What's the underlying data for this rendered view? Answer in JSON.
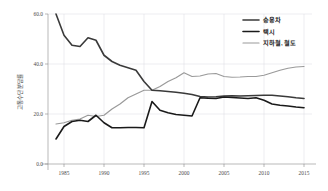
{
  "chart_data": {
    "type": "line",
    "title": "",
    "xlabel": "",
    "ylabel": "교통수단 분담률",
    "xlim": [
      1983,
      2016
    ],
    "ylim": [
      0.0,
      60.0
    ],
    "grid": true,
    "legend_position": "top-right",
    "x_ticks": [
      "1985",
      "1990",
      "1995",
      "2000",
      "2005",
      "2010",
      "2015"
    ],
    "x_tick_values": [
      1985,
      1990,
      1995,
      2000,
      2005,
      2010,
      2015
    ],
    "y_ticks": [
      "0.0",
      "20.0",
      "40.0",
      "60.0"
    ],
    "y_tick_values": [
      0.0,
      20.0,
      40.0,
      60.0
    ],
    "x": [
      1984,
      1985,
      1986,
      1987,
      1988,
      1989,
      1990,
      1991,
      1992,
      1993,
      1994,
      1995,
      1996,
      1997,
      1998,
      1999,
      2000,
      2001,
      2002,
      2003,
      2004,
      2005,
      2006,
      2007,
      2008,
      2009,
      2010,
      2011,
      2012,
      2013,
      2014,
      2015
    ],
    "series": [
      {
        "name": "승용차",
        "color": "#3a3a3a",
        "width": 1.6,
        "values": [
          60.0,
          51.5,
          47.5,
          47.0,
          50.5,
          49.5,
          43.5,
          41.0,
          39.5,
          38.5,
          37.5,
          33.0,
          29.5,
          29.3,
          29.0,
          28.7,
          28.3,
          27.8,
          27.0,
          26.8,
          26.9,
          27.2,
          27.3,
          27.2,
          27.3,
          27.4,
          27.5,
          27.5,
          27.2,
          26.9,
          26.5,
          26.2
        ]
      },
      {
        "name": "택시",
        "color": "#1a1a1a",
        "width": 1.6,
        "values": [
          10.0,
          15.0,
          17.0,
          17.5,
          17.0,
          19.5,
          16.5,
          14.5,
          14.5,
          14.6,
          14.6,
          14.5,
          25.0,
          21.5,
          20.5,
          19.8,
          19.5,
          19.2,
          26.5,
          26.3,
          26.2,
          26.8,
          26.6,
          26.4,
          26.2,
          26.5,
          25.5,
          24.0,
          23.5,
          23.2,
          22.8,
          22.5
        ]
      },
      {
        "name": "지하철, 철도",
        "color": "#9a9a9a",
        "width": 1.2,
        "values": [
          16.0,
          16.5,
          17.5,
          18.0,
          19.5,
          19.0,
          19.5,
          22.0,
          24.0,
          26.5,
          28.0,
          29.5,
          29.5,
          31.0,
          33.0,
          34.5,
          36.5,
          35.0,
          35.2,
          36.0,
          36.2,
          35.0,
          34.7,
          34.8,
          35.0,
          35.0,
          35.5,
          36.5,
          37.5,
          38.3,
          38.8,
          39.0
        ]
      }
    ]
  },
  "legend": {
    "items": [
      {
        "label": "승용차"
      },
      {
        "label": "택시"
      },
      {
        "label": "지하철, 철도"
      }
    ]
  },
  "axes": {
    "y_title": "교통수단 분담률"
  }
}
